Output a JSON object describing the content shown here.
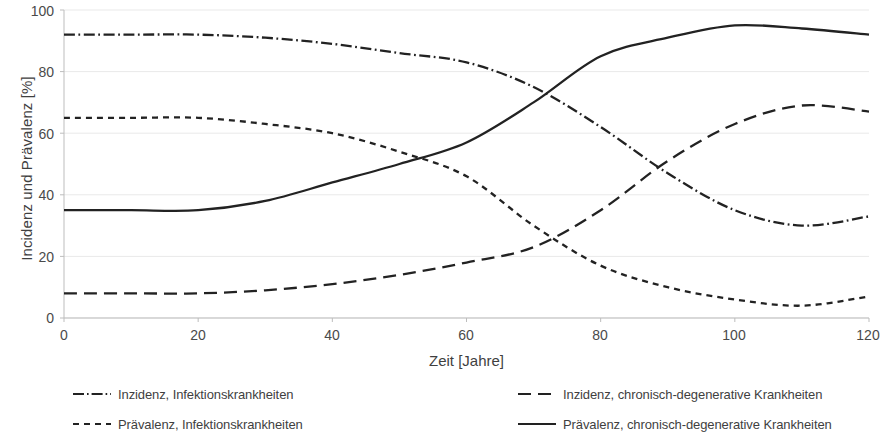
{
  "chart_data": {
    "type": "line",
    "title": "",
    "xlabel": "Zeit [Jahre]",
    "ylabel": "Incidenz und Prävalenz [%]",
    "xlim": [
      0,
      120
    ],
    "ylim": [
      0,
      100
    ],
    "xticks": [
      "0",
      "20",
      "40",
      "60",
      "80",
      "100",
      "120"
    ],
    "yticks": [
      "0",
      "20",
      "40",
      "60",
      "80",
      "100"
    ],
    "grid": "horizontal",
    "legend_position": "bottom",
    "x": [
      0,
      10,
      20,
      30,
      40,
      50,
      60,
      70,
      80,
      90,
      100,
      110,
      120
    ],
    "series": [
      {
        "name": "Inzidenz, Infektionskrankheiten",
        "style": "dash-dot",
        "color": "#222222",
        "values": [
          92,
          92,
          92,
          91,
          89,
          86,
          83,
          75,
          62,
          47,
          35,
          30,
          33
        ]
      },
      {
        "name": "Prävalenz, Infektionskrankheiten",
        "style": "dotted-short-dash",
        "color": "#222222",
        "values": [
          65,
          65,
          65,
          63,
          60,
          54,
          46,
          30,
          17,
          10,
          6,
          4,
          7
        ]
      },
      {
        "name": "Inzidenz, chronisch-degenerative Krankheiten",
        "style": "long-dash",
        "color": "#222222",
        "values": [
          8,
          8,
          8,
          9,
          11,
          14,
          18,
          23,
          35,
          51,
          63,
          69,
          67
        ]
      },
      {
        "name": "Prävalenz, chronisch-degenerative Krankheiten",
        "style": "solid",
        "color": "#222222",
        "values": [
          35,
          35,
          35,
          38,
          44,
          50,
          57,
          70,
          85,
          91,
          95,
          94,
          92
        ]
      }
    ]
  },
  "axes": {
    "y_title": "Incidenz und Prävalenz [%]",
    "x_title": "Zeit [Jahre]",
    "y_tick_labels": [
      "100",
      "80",
      "60",
      "40",
      "20",
      "0"
    ],
    "x_tick_labels": [
      "0",
      "20",
      "40",
      "60",
      "80",
      "100",
      "120"
    ]
  },
  "legend": {
    "items": [
      {
        "label": "Inzidenz, Infektionskrankheiten",
        "style": "dash-dot"
      },
      {
        "label": "Prävalenz, Infektionskrankheiten",
        "style": "short-dash"
      },
      {
        "label": "Inzidenz, chronisch-degenerative Krankheiten",
        "style": "long-dash"
      },
      {
        "label": "Prävalenz, chronisch-degenerative Krankheiten",
        "style": "solid"
      }
    ]
  },
  "colors": {
    "line": "#222222",
    "axis": "#b7b7b7",
    "grid": "#e9e9e9",
    "text": "#3f3f3f"
  }
}
